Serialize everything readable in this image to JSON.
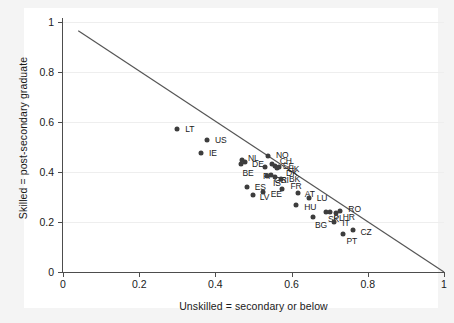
{
  "chart_data": {
    "type": "scatter",
    "title": "",
    "xlabel": "Unskilled = secondary or below",
    "ylabel": "Skilled = post-secondary graduate",
    "xlim": [
      0,
      1
    ],
    "ylim": [
      0,
      1
    ],
    "xticks": [
      "0",
      "0.2",
      "0.4",
      "0.6",
      "0.8",
      "1"
    ],
    "xtick_values": [
      0,
      0.2,
      0.4,
      0.6,
      0.8,
      1
    ],
    "yticks": [
      "0",
      "0.2",
      "0.4",
      "0.6",
      "0.8",
      "1"
    ],
    "ytick_values": [
      0,
      0.2,
      0.4,
      0.6,
      0.8,
      1
    ],
    "grid": "horizontal-faint",
    "legend": "none",
    "marker_color": "#3d3d3d",
    "line_color": "#555555",
    "points": [
      {
        "label": "LT",
        "x": 0.3,
        "y": 0.572,
        "lx": 8,
        "ly": 0
      },
      {
        "label": "US",
        "x": 0.378,
        "y": 0.528,
        "lx": 8,
        "ly": 0
      },
      {
        "label": "IE",
        "x": 0.362,
        "y": 0.478,
        "lx": 8,
        "ly": 0
      },
      {
        "label": "NO",
        "x": 0.538,
        "y": 0.465,
        "lx": 8,
        "ly": -1
      },
      {
        "label": "NL",
        "x": 0.47,
        "y": 0.448,
        "lx": 6,
        "ly": -2
      },
      {
        "label": "DE",
        "x": 0.478,
        "y": 0.441,
        "lx": 7,
        "ly": 2
      },
      {
        "label": "BE",
        "x": 0.466,
        "y": 0.433,
        "lx": 2,
        "ly": 9
      },
      {
        "label": "CH",
        "x": 0.548,
        "y": 0.432,
        "lx": 8,
        "ly": -3
      },
      {
        "label": "SE",
        "x": 0.556,
        "y": 0.425,
        "lx": 8,
        "ly": 0
      },
      {
        "label": "UK",
        "x": 0.566,
        "y": 0.422,
        "lx": 9,
        "ly": 2
      },
      {
        "label": "FI",
        "x": 0.53,
        "y": 0.42,
        "lx": -2,
        "ly": 9
      },
      {
        "label": "DK",
        "x": 0.562,
        "y": 0.415,
        "lx": 9,
        "ly": 5
      },
      {
        "label": "IS",
        "x": 0.546,
        "y": 0.39,
        "lx": 2,
        "ly": 8
      },
      {
        "label": "GR",
        "x": 0.536,
        "y": 0.383,
        "lx": 7,
        "ly": 4
      },
      {
        "label": "SI",
        "x": 0.556,
        "y": 0.38,
        "lx": 6,
        "ly": 3
      },
      {
        "label": "BK",
        "x": 0.572,
        "y": 0.374,
        "lx": 8,
        "ly": 0
      },
      {
        "label": "ES",
        "x": 0.482,
        "y": 0.342,
        "lx": 8,
        "ly": 0
      },
      {
        "label": "LV",
        "x": 0.498,
        "y": 0.308,
        "lx": 7,
        "ly": 2
      },
      {
        "label": "EE",
        "x": 0.524,
        "y": 0.32,
        "lx": 8,
        "ly": 2
      },
      {
        "label": "FR",
        "x": 0.576,
        "y": 0.333,
        "lx": 8,
        "ly": -3
      },
      {
        "label": "AT",
        "x": 0.616,
        "y": 0.318,
        "lx": 7,
        "ly": 1
      },
      {
        "label": "LU",
        "x": 0.645,
        "y": 0.298,
        "lx": 8,
        "ly": 0
      },
      {
        "label": "HU",
        "x": 0.612,
        "y": 0.268,
        "lx": 8,
        "ly": 2
      },
      {
        "label": "BG",
        "x": 0.656,
        "y": 0.222,
        "lx": 2,
        "ly": 8
      },
      {
        "label": "SK",
        "x": 0.69,
        "y": 0.242,
        "lx": 2,
        "ly": 7
      },
      {
        "label": "PL",
        "x": 0.702,
        "y": 0.24,
        "lx": 3,
        "ly": 6
      },
      {
        "label": "HR",
        "x": 0.716,
        "y": 0.238,
        "lx": 7,
        "ly": 4
      },
      {
        "label": "RO",
        "x": 0.728,
        "y": 0.245,
        "lx": 8,
        "ly": -2
      },
      {
        "label": "IT",
        "x": 0.712,
        "y": 0.2,
        "lx": 8,
        "ly": 1
      },
      {
        "label": "PT",
        "x": 0.736,
        "y": 0.152,
        "lx": 3,
        "ly": 7
      },
      {
        "label": "CZ",
        "x": 0.76,
        "y": 0.168,
        "lx": 8,
        "ly": 2
      }
    ],
    "fit_line": {
      "x1": 0.04,
      "y1": 0.965,
      "x2": 1.0,
      "y2": 0.0
    }
  }
}
